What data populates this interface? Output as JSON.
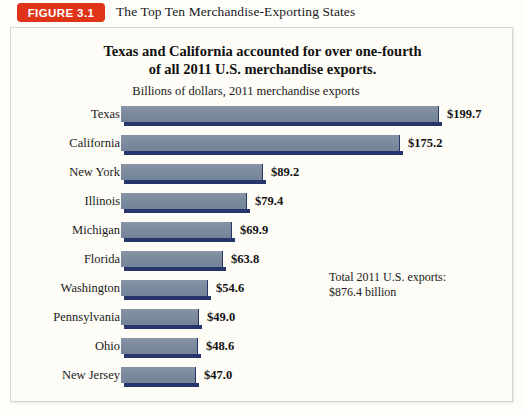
{
  "header": {
    "badge_label": "FIGURE 3.1",
    "caption": "The Top Ten Merchandise-Exporting States",
    "badge_color": "#e03419"
  },
  "chart_panel": {
    "title_line1": "Texas and California accounted for over one-fourth",
    "title_line2": "of all 2011 U.S. merchandise exports.",
    "subtitle": "Billions of dollars, 2011 merchandise exports",
    "annotation_line1": "Total 2011 U.S. exports:",
    "annotation_line2": "$876.4 billion",
    "bar_color": "#7c8b9d",
    "bar_shadow_color": "#27356d",
    "background_color": "#fdfcf6"
  },
  "chart_data": {
    "type": "bar",
    "orientation": "horizontal",
    "title": "Texas and California accounted for over one-fourth of all 2011 U.S. merchandise exports.",
    "subtitle": "Billions of dollars, 2011 merchandise exports",
    "xlabel": "Billions of dollars",
    "ylabel": "",
    "xlim": [
      0,
      210
    ],
    "grid": false,
    "legend": false,
    "categories": [
      "Texas",
      "California",
      "New York",
      "Illinois",
      "Michigan",
      "Florida",
      "Washington",
      "Pennsylvania",
      "Ohio",
      "New Jersey"
    ],
    "values": [
      199.7,
      175.2,
      89.2,
      79.4,
      69.9,
      63.8,
      54.6,
      49.0,
      48.6,
      47.0
    ],
    "value_labels": [
      "$199.7",
      "$175.2",
      "$89.2",
      "$79.4",
      "$69.9",
      "$63.8",
      "$54.6",
      "$49.0",
      "$48.6",
      "$47.0"
    ],
    "annotation": "Total 2011 U.S. exports: $876.4 billion"
  }
}
